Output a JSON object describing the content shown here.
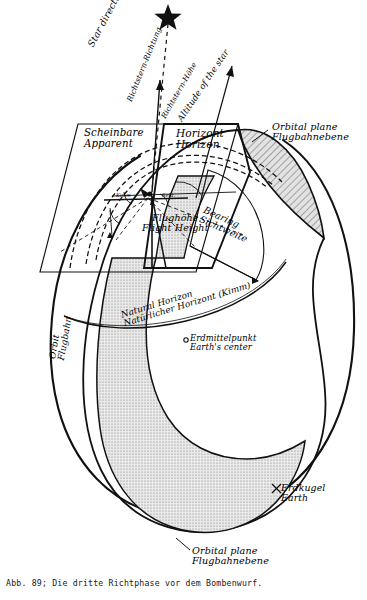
{
  "figure": {
    "caption": "Abb. 89; Die dritte Richtphase vor dem Bombenwurf.",
    "caption_number": "Abb. 89",
    "subject": "Die dritte Richtphase vor dem Bombenwurf"
  },
  "labels": {
    "star_direction": {
      "en": "Star direction",
      "de": "Richtstern-Richtung"
    },
    "star_altitude": {
      "en": "Altitude of the star",
      "de": "Richtstern-Höhe"
    },
    "apparent_horizon": {
      "de": "Scheinbare",
      "en": "Apparent"
    },
    "horizon": {
      "de": "Horizont",
      "en": "Horizon"
    },
    "orbital_plane_top": {
      "en": "Orbital plane",
      "de": "Flugbahnebene"
    },
    "orbital_plane_bottom": {
      "en": "Orbital plane",
      "de": "Flugbahnebene"
    },
    "flight_height": {
      "de": "Flughöhe",
      "en": "Flight Height"
    },
    "bearing": {
      "en": "Bearing",
      "de": "Sichtweite"
    },
    "natural_horizon": {
      "en": "Natural Horizon",
      "de": "Natürlicher Horizont (Kimm)"
    },
    "earth_center": {
      "de": "Erdmittelpunkt",
      "en": "Earth's center"
    },
    "orbit": {
      "en": "Orbit",
      "de": "Flugbahn"
    },
    "earth": {
      "de": "Erdkugel",
      "en": "Earth"
    }
  },
  "angle_marks": {
    "left_mark": "Kimm",
    "right_mark": "Sekt."
  },
  "icons": {
    "star": "★",
    "earth_center_marker": "o",
    "earth_marker": "×"
  },
  "colors": {
    "ink": "#111111",
    "paper": "#ffffff",
    "hatch": "#8a8a8a",
    "hatch_fill": "#d8d8d8"
  }
}
